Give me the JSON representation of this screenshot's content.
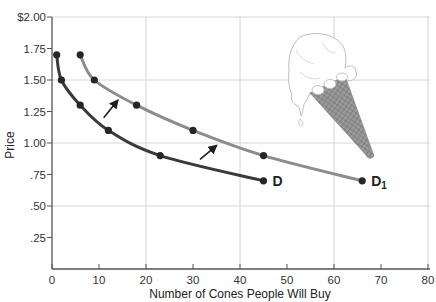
{
  "chart_data": {
    "type": "line",
    "title": "",
    "xlabel": "Number of Cones People Will Buy",
    "ylabel": "Price",
    "xlim": [
      0,
      80
    ],
    "ylim": [
      0,
      2.0
    ],
    "x_ticks": [
      0,
      10,
      20,
      30,
      40,
      50,
      60,
      70,
      80
    ],
    "x_tick_labels": [
      "0",
      "10",
      "20",
      "30",
      "40",
      "50",
      "60",
      "70",
      "80"
    ],
    "y_ticks": [
      0.25,
      0.5,
      0.75,
      1.0,
      1.25,
      1.5,
      1.75,
      2.0
    ],
    "y_tick_labels": [
      ".25",
      ".50",
      ".75",
      "1.00",
      "1.25",
      "1.50",
      "1.75",
      "$2.00"
    ],
    "grid": {
      "x": [
        20,
        40,
        60,
        80
      ],
      "y": [
        0.5,
        1.0,
        1.5,
        2.0
      ]
    },
    "legend": "none (curves labeled inline)",
    "series": [
      {
        "name": "D",
        "label": "D",
        "color": "#3a3a3a",
        "x": [
          1,
          2,
          6,
          12,
          23,
          45
        ],
        "y": [
          1.7,
          1.5,
          1.3,
          1.1,
          0.9,
          0.7
        ]
      },
      {
        "name": "D1",
        "label": "D",
        "label_subscript": "1",
        "color": "#8c8c8c",
        "x": [
          6,
          9,
          18,
          30,
          45,
          66
        ],
        "y": [
          1.7,
          1.5,
          1.3,
          1.1,
          0.9,
          0.7
        ]
      }
    ],
    "annotations": [
      {
        "type": "arrow",
        "description": "shift arrow from D toward D1",
        "from": [
          11,
          1.2
        ],
        "to": [
          14,
          1.34
        ]
      },
      {
        "type": "arrow",
        "description": "shift arrow from D toward D1",
        "from": [
          31.5,
          0.87
        ],
        "to": [
          35,
          0.98
        ]
      },
      {
        "type": "illustration",
        "description": "ice cream cone drawing",
        "position": "upper right"
      }
    ]
  },
  "colors": {
    "curve_d": "#3a3a3a",
    "curve_d1": "#8c8c8c",
    "points": "#262626",
    "grid": "#d4d4d4",
    "axis": "#555555"
  }
}
